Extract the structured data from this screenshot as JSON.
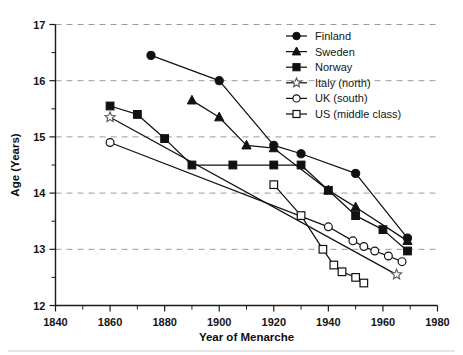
{
  "chart_data": {
    "type": "line",
    "title": "",
    "xlabel": "Year of Menarche",
    "ylabel": "Age (Years)",
    "xlim": [
      1840,
      1980
    ],
    "ylim": [
      12,
      17
    ],
    "x_major_ticks": [
      1840,
      1860,
      1880,
      1900,
      1920,
      1940,
      1960,
      1980
    ],
    "x_tick_labels": [
      "1840",
      "1860",
      "1880",
      "1900",
      "1920",
      "1940",
      "1960",
      "1980"
    ],
    "x_minor_step": 10,
    "y_major_ticks": [
      12,
      13,
      14,
      15,
      16,
      17
    ],
    "y_tick_labels": [
      "12",
      "13",
      "14",
      "15",
      "16",
      "17"
    ],
    "y_minor_step": 0.5,
    "grid": "horizontal-dashed",
    "legend_position": "top-right",
    "series": [
      {
        "name": "Finland",
        "marker": "filled-circle",
        "x": [
          1875,
          1900,
          1920,
          1930,
          1950,
          1969
        ],
        "y": [
          16.45,
          16.0,
          14.85,
          14.7,
          14.35,
          13.2
        ]
      },
      {
        "name": "Sweden",
        "marker": "filled-triangle",
        "x": [
          1890,
          1900,
          1910,
          1920,
          1940,
          1950,
          1969
        ],
        "y": [
          15.65,
          15.35,
          14.85,
          14.8,
          14.05,
          13.75,
          13.15
        ]
      },
      {
        "name": "Norway",
        "marker": "filled-square",
        "x": [
          1860,
          1870,
          1880,
          1890,
          1905,
          1920,
          1930,
          1940,
          1950,
          1960,
          1969
        ],
        "y": [
          15.55,
          15.4,
          14.97,
          14.5,
          14.5,
          14.5,
          14.5,
          14.05,
          13.6,
          13.35,
          12.97
        ]
      },
      {
        "name": "Italy (north)",
        "marker": "open-star",
        "x": [
          1860,
          1965
        ],
        "y": [
          15.35,
          12.55
        ]
      },
      {
        "name": "UK (south)",
        "marker": "open-circle",
        "x": [
          1860,
          1940,
          1949,
          1953,
          1957,
          1962,
          1967
        ],
        "y": [
          14.9,
          13.4,
          13.15,
          13.05,
          12.97,
          12.88,
          12.78
        ]
      },
      {
        "name": "US (middle class)",
        "marker": "open-square",
        "x": [
          1920,
          1930,
          1938,
          1942,
          1945,
          1950,
          1953
        ],
        "y": [
          14.15,
          13.6,
          13.0,
          12.72,
          12.6,
          12.5,
          12.4
        ]
      }
    ]
  },
  "legend": {
    "entries": [
      {
        "label": "Finland",
        "marker": "filled-circle"
      },
      {
        "label": "Sweden",
        "marker": "filled-triangle"
      },
      {
        "label": "Norway",
        "marker": "filled-square"
      },
      {
        "label": "Italy (north)",
        "marker": "open-star"
      },
      {
        "label": "UK (south)",
        "marker": "open-circle"
      },
      {
        "label": "US (middle class)",
        "marker": "open-square"
      }
    ]
  }
}
